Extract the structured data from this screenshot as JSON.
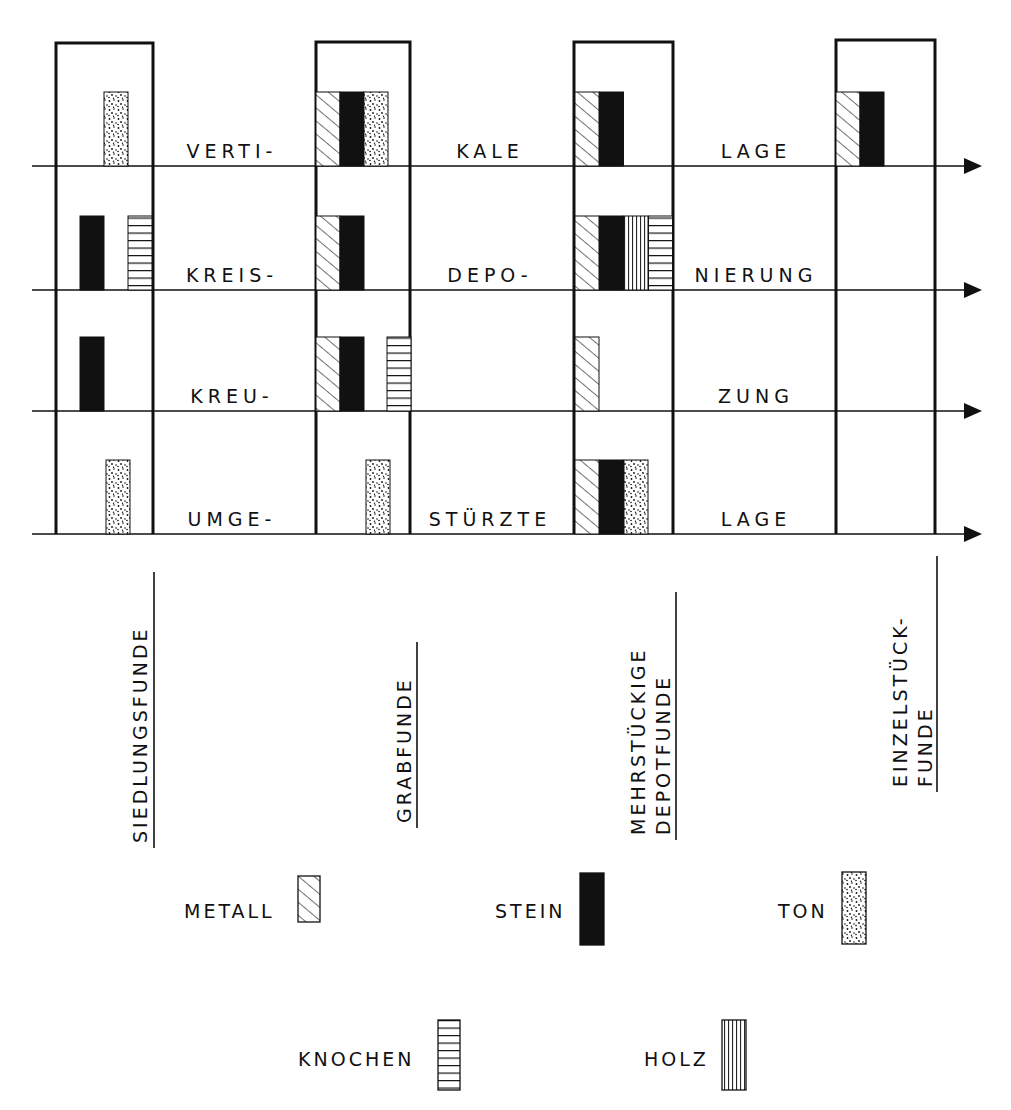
{
  "chart_data": {
    "type": "diagram",
    "title": "",
    "columns": [
      {
        "key": "siedlung",
        "label_lines": [
          "SIEDLUNGSFUNDE"
        ]
      },
      {
        "key": "grab",
        "label_lines": [
          "GRABFUNDE"
        ]
      },
      {
        "key": "depot",
        "label_lines": [
          "MEHRSTÜCKIGE",
          "DEPOTFUNDE"
        ]
      },
      {
        "key": "einzel",
        "label_lines": [
          "EINZELSTÜCK-",
          "FUNDE"
        ]
      }
    ],
    "rows": [
      {
        "key": "vertikale_lage",
        "label_parts": [
          "VERTI-",
          "KALE",
          "LAGE"
        ],
        "cells": {
          "siedlung": [
            "ton"
          ],
          "grab": [
            "metall",
            "stein",
            "ton"
          ],
          "depot": [
            "metall",
            "stein"
          ],
          "einzel": [
            "metall",
            "stein"
          ]
        }
      },
      {
        "key": "kreisdeponierung",
        "label_parts": [
          "KREIS-",
          "DEPO-",
          "NIERUNG"
        ],
        "cells": {
          "siedlung": [
            "stein",
            "knochen"
          ],
          "grab": [
            "metall",
            "stein"
          ],
          "depot": [
            "metall",
            "stein",
            "holz",
            "knochen"
          ],
          "einzel": []
        }
      },
      {
        "key": "kreuzung",
        "label_parts": [
          "KREU-",
          "",
          "ZUNG"
        ],
        "cells": {
          "siedlung": [
            "stein"
          ],
          "grab": [
            "metall",
            "stein",
            "knochen"
          ],
          "depot": [
            "metall"
          ],
          "einzel": []
        }
      },
      {
        "key": "umgestuerzte_lage",
        "label_parts": [
          "UMGE-",
          "STÜRZTE",
          "LAGE"
        ],
        "cells": {
          "siedlung": [
            "ton"
          ],
          "grab": [
            "ton"
          ],
          "depot": [
            "metall",
            "stein",
            "ton"
          ],
          "einzel": []
        }
      }
    ],
    "legend": [
      {
        "key": "metall",
        "label": "METALL",
        "pattern": "diagonal-hatch"
      },
      {
        "key": "stein",
        "label": "STEIN",
        "pattern": "solid-black"
      },
      {
        "key": "ton",
        "label": "TON",
        "pattern": "stipple"
      },
      {
        "key": "knochen",
        "label": "KNOCHEN",
        "pattern": "horizontal-lines"
      },
      {
        "key": "holz",
        "label": "HOLZ",
        "pattern": "vertical-lines"
      }
    ]
  },
  "colors": {
    "ink": "#111111",
    "paper": "#ffffff"
  }
}
